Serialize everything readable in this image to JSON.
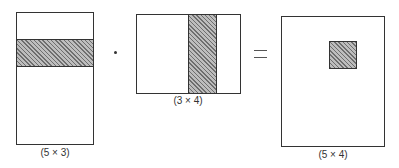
{
  "diagram": {
    "type": "block-matrix-multiplication",
    "operator_dot": "·",
    "operator_equals": "=",
    "matrices": [
      {
        "name": "A",
        "dims_label": "(5 × 3)",
        "highlight": "row"
      },
      {
        "name": "B",
        "dims_label": "(3 × 4)",
        "highlight": "column"
      },
      {
        "name": "C",
        "dims_label": "(5 × 4)",
        "highlight": "element"
      }
    ],
    "colors": {
      "outline": "#333333",
      "hatch": "#6e6e6e",
      "hatch_bg": "#bdbdbd"
    }
  }
}
